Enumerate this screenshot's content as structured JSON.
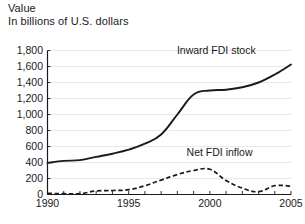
{
  "header": {
    "title_line1": "Value",
    "title_line2": "In billions of U.S. dollars"
  },
  "chart_data": {
    "type": "line",
    "title": "Value",
    "subtitle": "In billions of U.S. dollars",
    "xlabel": "",
    "ylabel": "In billions of U.S. dollars",
    "xlim": [
      1990,
      2005
    ],
    "ylim": [
      0,
      1800
    ],
    "grid": true,
    "legend_position": "inline-annotation",
    "y_ticks": [
      0,
      200,
      400,
      600,
      800,
      1000,
      1200,
      1400,
      1600,
      1800
    ],
    "y_tick_labels": [
      "0",
      "200",
      "400",
      "600",
      "800",
      "1,000",
      "1,200",
      "1,400",
      "1,600",
      "1,800"
    ],
    "x_ticks": [
      1990,
      1991,
      1992,
      1993,
      1994,
      1995,
      1996,
      1997,
      1998,
      1999,
      2000,
      2001,
      2002,
      2003,
      2004,
      2005
    ],
    "x_tick_labels": [
      "1990",
      "",
      "",
      "",
      "",
      "1995",
      "",
      "",
      "",
      "",
      "2000",
      "",
      "",
      "",
      "",
      "2005"
    ],
    "x": [
      1990,
      1991,
      1992,
      1993,
      1994,
      1995,
      1996,
      1997,
      1998,
      1999,
      2000,
      2001,
      2002,
      2003,
      2004,
      2005
    ],
    "series": [
      {
        "name": "Inward FDI stock",
        "style": "solid",
        "color": "#1a1a1a",
        "values": [
          395,
          420,
          430,
          470,
          510,
          560,
          635,
          750,
          1000,
          1250,
          1300,
          1310,
          1340,
          1400,
          1500,
          1625
        ]
      },
      {
        "name": "Net FDI inflow",
        "style": "dashed",
        "color": "#1a1a1a",
        "values": [
          15,
          10,
          10,
          45,
          50,
          60,
          110,
          180,
          250,
          300,
          315,
          175,
          80,
          35,
          110,
          105
        ]
      }
    ],
    "annotations": [
      {
        "text": "Inward FDI stock",
        "x": 2000.4,
        "y": 1760
      },
      {
        "text": "Net FDI inflow",
        "x": 2000.6,
        "y": 480
      }
    ]
  }
}
